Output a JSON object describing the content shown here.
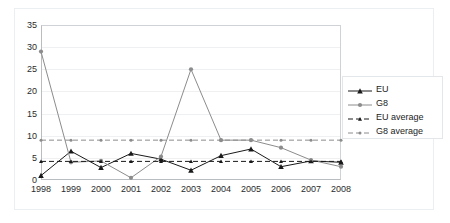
{
  "chart_data": {
    "type": "line",
    "title": "",
    "subtitle": "",
    "xlabel": "",
    "ylabel": "",
    "grid": true,
    "legend_position": "right",
    "xlim": [
      1998,
      2008
    ],
    "ylim": [
      0,
      35
    ],
    "y_ticks": [
      0,
      5,
      10,
      15,
      20,
      25,
      30,
      35
    ],
    "categories": [
      "1998",
      "1999",
      "2000",
      "2001",
      "2002",
      "2003",
      "2004",
      "2005",
      "2006",
      "2007",
      "2008"
    ],
    "series": [
      {
        "name": "EU",
        "style": "solid",
        "marker": "triangle",
        "color": "#1a1a1a",
        "values": [
          1,
          6.5,
          2.8,
          6,
          4.7,
          2.2,
          5.5,
          7,
          3,
          4.3,
          4
        ]
      },
      {
        "name": "G8",
        "style": "solid",
        "marker": "circle",
        "color": "#8c8c8c",
        "values": [
          29,
          4,
          4.3,
          0.5,
          5.3,
          25,
          9,
          9,
          7.3,
          4.5,
          3
        ]
      },
      {
        "name": "EU average",
        "style": "dashed",
        "marker": "triangle",
        "color": "#1a1a1a",
        "constant": 4.2,
        "values": [
          4.2,
          4.2,
          4.2,
          4.2,
          4.2,
          4.2,
          4.2,
          4.2,
          4.2,
          4.2,
          4.2
        ]
      },
      {
        "name": "G8 average",
        "style": "dashed",
        "marker": "circle",
        "color": "#8c8c8c",
        "constant": 9,
        "values": [
          9,
          9,
          9,
          9,
          9,
          9,
          9,
          9,
          9,
          9,
          9
        ]
      }
    ]
  },
  "legend": {
    "items": [
      {
        "label": "EU"
      },
      {
        "label": "G8"
      },
      {
        "label": "EU average"
      },
      {
        "label": "G8 average"
      }
    ]
  },
  "colors": {
    "eu": "#1a1a1a",
    "g8": "#8c8c8c",
    "grid": "#eef0f2",
    "axis": "#b9bcc0",
    "frame": "#eceff1",
    "background": "#ffffff"
  }
}
